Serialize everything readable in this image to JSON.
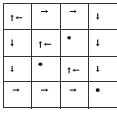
{
  "diagram": {
    "type": "gridworld-policy",
    "rows": 4,
    "cols": 4,
    "line_color": "#333333",
    "symbol_color": "#111111",
    "cells": [
      [
        {
          "actions": [
            "up",
            "left"
          ]
        },
        {
          "actions": [
            "right"
          ]
        },
        {
          "actions": [
            "right"
          ]
        },
        {
          "actions": [
            "down"
          ]
        }
      ],
      [
        {
          "actions": [
            "down"
          ]
        },
        {
          "actions": [
            "left",
            "up"
          ]
        },
        {
          "actions": [
            "terminal"
          ]
        },
        {
          "actions": [
            "down"
          ]
        }
      ],
      [
        {
          "actions": [
            "down"
          ]
        },
        {
          "actions": [
            "terminal"
          ]
        },
        {
          "actions": [
            "up",
            "left"
          ]
        },
        {
          "actions": [
            "down"
          ]
        }
      ],
      [
        {
          "actions": [
            "right"
          ]
        },
        {
          "actions": [
            "right"
          ]
        },
        {
          "actions": [
            "right"
          ]
        },
        {
          "actions": [
            "terminal"
          ]
        }
      ]
    ]
  }
}
